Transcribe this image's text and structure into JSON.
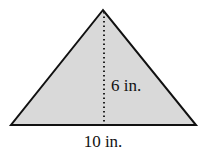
{
  "diagram": {
    "shape": "triangle",
    "fill_color": "#d9d9d9",
    "stroke_color": "#111111",
    "height_label": "6 in.",
    "base_label": "10 in.",
    "height_line_style": "dotted"
  }
}
